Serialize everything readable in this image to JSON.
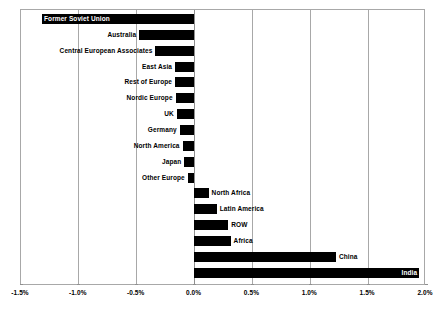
{
  "chart_data": {
    "type": "bar",
    "orientation": "horizontal",
    "title": "",
    "subtitle": "",
    "xlabel": "",
    "ylabel": "",
    "xlim": [
      -1.5,
      2.0
    ],
    "xtick_values": [
      -1.5,
      -1.0,
      -0.5,
      0.0,
      0.5,
      1.0,
      1.5,
      2.0
    ],
    "xtick_labels": [
      "-1.5%",
      "-1.0%",
      "-0.5%",
      "0.0%",
      "0.5%",
      "1.0%",
      "1.5%",
      "2.0%"
    ],
    "grid": true,
    "grid_axis": "x",
    "legend": false,
    "legend_position": "none",
    "bar_color": "#000000",
    "categories": [
      "Former Soviet Union",
      "Australia",
      "Central European Associates",
      "East Asia",
      "Rest of Europe",
      "Nordic Europe",
      "UK",
      "Germany",
      "North America",
      "Japan",
      "Other Europe",
      "North Africa",
      "Latin America",
      "ROW",
      "Africa",
      "China",
      "India"
    ],
    "values": [
      -1.31,
      -0.47,
      -0.33,
      -0.16,
      -0.16,
      -0.155,
      -0.145,
      -0.12,
      -0.095,
      -0.08,
      -0.05,
      0.13,
      0.2,
      0.3,
      0.32,
      1.23,
      1.95
    ],
    "value_unit": "percent",
    "label_placement": [
      "inside-bar-left",
      "outside-left",
      "outside-left",
      "outside-left",
      "outside-left",
      "outside-left",
      "outside-left",
      "outside-left",
      "outside-left",
      "outside-left",
      "outside-left",
      "outside-right",
      "outside-right",
      "outside-right",
      "outside-right",
      "outside-right",
      "inside-bar-right"
    ]
  }
}
